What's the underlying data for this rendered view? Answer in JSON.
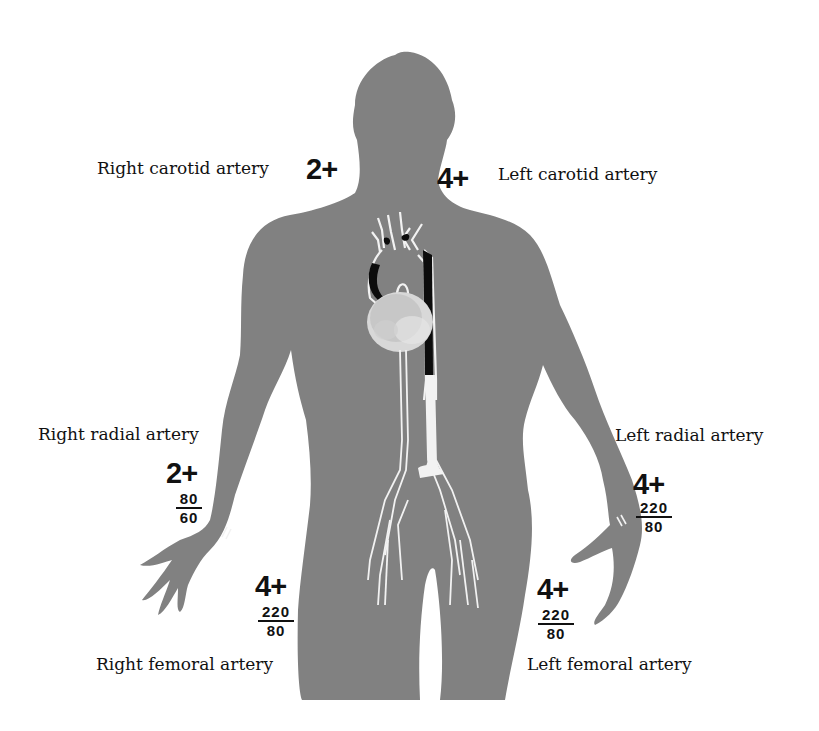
{
  "figure": {
    "colors": {
      "body": "#818181",
      "vessel_highlight": "#f2f2f2",
      "aorta_dark": "#0c0c0c",
      "text": "#111111",
      "background": "#ffffff"
    },
    "sites": {
      "right_carotid": {
        "label": "Right carotid artery",
        "grade": "2+"
      },
      "left_carotid": {
        "label": "Left carotid artery",
        "grade": "4+"
      },
      "right_radial": {
        "label": "Right radial artery",
        "grade": "2+",
        "bp_systolic": "80",
        "bp_diastolic": "60"
      },
      "left_radial": {
        "label": "Left radial artery",
        "grade": "4+",
        "bp_systolic": "220",
        "bp_diastolic": "80"
      },
      "right_femoral": {
        "label": "Right femoral artery",
        "grade": "4+",
        "bp_systolic": "220",
        "bp_diastolic": "80"
      },
      "left_femoral": {
        "label": "Left femoral artery",
        "grade": "4+",
        "bp_systolic": "220",
        "bp_diastolic": "80"
      }
    },
    "icons": [
      "body-silhouette",
      "heart-icon",
      "aorta-icon",
      "dissection-flap-icon",
      "pulse-marker-icon"
    ]
  }
}
